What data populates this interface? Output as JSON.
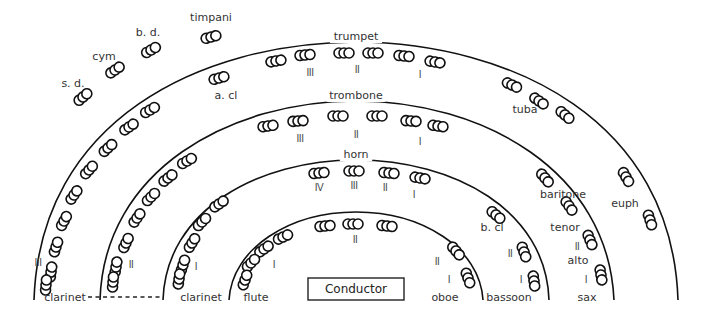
{
  "diagram": {
    "conductor": {
      "label": "Conductor",
      "x": 308,
      "y": 278,
      "w": 96,
      "h": 22
    },
    "arcs": [
      {
        "name": "outer-arc",
        "d": "M 34 300 C 40 120, 200 43, 356 42 C 512 43, 672 120, 678 300"
      },
      {
        "name": "second-arc",
        "d": "M 100 300 C 104 170, 230 101, 356 101 C 482 101, 608 170, 614 300"
      },
      {
        "name": "third-arc",
        "d": "M 163 300 C 166 210, 258 160, 356 160 C 454 160, 546 210, 549 300"
      },
      {
        "name": "inner-arc",
        "d": "M 229 300 C 232 248, 290 212, 356 212 C 422 212, 480 248, 483 300"
      }
    ],
    "section_labels": [
      {
        "text": "trumpet",
        "x": 356,
        "y": 40
      },
      {
        "text": "trombone",
        "x": 356,
        "y": 99
      },
      {
        "text": "horn",
        "x": 356,
        "y": 158
      },
      {
        "text": "timpani",
        "x": 211,
        "y": 21
      },
      {
        "text": "b. d.",
        "x": 148,
        "y": 36
      },
      {
        "text": "cym",
        "x": 104,
        "y": 60
      },
      {
        "text": "s. d.",
        "x": 73,
        "y": 87
      },
      {
        "text": "a. cl",
        "x": 226,
        "y": 99
      },
      {
        "text": "tuba",
        "x": 525,
        "y": 113
      },
      {
        "text": "baritone",
        "x": 563,
        "y": 198
      },
      {
        "text": "euph",
        "x": 625,
        "y": 207
      },
      {
        "text": "tenor",
        "x": 565,
        "y": 231
      },
      {
        "text": "b. cl",
        "x": 492,
        "y": 231
      },
      {
        "text": "alto",
        "x": 578,
        "y": 264
      },
      {
        "text": "clarinet",
        "x": 65,
        "y": 301
      },
      {
        "text": "clarinet",
        "x": 201,
        "y": 301
      },
      {
        "text": "flute",
        "x": 256,
        "y": 301
      },
      {
        "text": "oboe",
        "x": 445,
        "y": 301
      },
      {
        "text": "bassoon",
        "x": 509,
        "y": 301
      },
      {
        "text": "sax",
        "x": 587,
        "y": 301
      }
    ],
    "part_numbers": [
      {
        "text": "III",
        "x": 310,
        "y": 76
      },
      {
        "text": "II",
        "x": 357,
        "y": 73
      },
      {
        "text": "I",
        "x": 420,
        "y": 78
      },
      {
        "text": "III",
        "x": 300,
        "y": 142
      },
      {
        "text": "II",
        "x": 356,
        "y": 138
      },
      {
        "text": "I",
        "x": 420,
        "y": 145
      },
      {
        "text": "IV",
        "x": 319,
        "y": 191
      },
      {
        "text": "III",
        "x": 354,
        "y": 189
      },
      {
        "text": "II",
        "x": 385,
        "y": 191
      },
      {
        "text": "I",
        "x": 414,
        "y": 198
      },
      {
        "text": "II",
        "x": 355,
        "y": 243
      },
      {
        "text": "III",
        "x": 38,
        "y": 266
      },
      {
        "text": "II",
        "x": 131,
        "y": 268
      },
      {
        "text": "I",
        "x": 196,
        "y": 270
      },
      {
        "text": "I",
        "x": 274,
        "y": 268
      },
      {
        "text": "II",
        "x": 437,
        "y": 265
      },
      {
        "text": "I",
        "x": 449,
        "y": 283
      },
      {
        "text": "II",
        "x": 510,
        "y": 257
      },
      {
        "text": "I",
        "x": 521,
        "y": 283
      },
      {
        "text": "II",
        "x": 577,
        "y": 250
      },
      {
        "text": "I",
        "x": 586,
        "y": 283
      }
    ],
    "dashed_link": {
      "x1": 88,
      "y1": 297,
      "x2": 161,
      "y2": 297
    },
    "seats": [
      {
        "x": 211,
        "y": 37,
        "r": -15
      },
      {
        "x": 151,
        "y": 50,
        "r": -30
      },
      {
        "x": 115,
        "y": 70,
        "r": -35
      },
      {
        "x": 83,
        "y": 97,
        "r": -40
      },
      {
        "x": 219,
        "y": 78,
        "r": -15
      },
      {
        "x": 276,
        "y": 61,
        "r": -10
      },
      {
        "x": 305,
        "y": 55,
        "r": -5
      },
      {
        "x": 344,
        "y": 53,
        "r": 0
      },
      {
        "x": 373,
        "y": 53,
        "r": 0
      },
      {
        "x": 404,
        "y": 56,
        "r": 5
      },
      {
        "x": 435,
        "y": 62,
        "r": 10
      },
      {
        "x": 150,
        "y": 110,
        "r": -30
      },
      {
        "x": 129,
        "y": 127,
        "r": -35
      },
      {
        "x": 108,
        "y": 148,
        "r": -42
      },
      {
        "x": 89,
        "y": 170,
        "r": -48
      },
      {
        "x": 74,
        "y": 195,
        "r": -55
      },
      {
        "x": 64,
        "y": 221,
        "r": -62
      },
      {
        "x": 56,
        "y": 247,
        "r": -72
      },
      {
        "x": 51,
        "y": 272,
        "r": -82
      },
      {
        "x": 46,
        "y": 285,
        "r": -85
      },
      {
        "x": 268,
        "y": 126,
        "r": -8
      },
      {
        "x": 298,
        "y": 121,
        "r": -4
      },
      {
        "x": 338,
        "y": 116,
        "r": 0
      },
      {
        "x": 377,
        "y": 116,
        "r": 0
      },
      {
        "x": 411,
        "y": 121,
        "r": 4
      },
      {
        "x": 438,
        "y": 126,
        "r": 8
      },
      {
        "x": 187,
        "y": 161,
        "r": -30
      },
      {
        "x": 168,
        "y": 178,
        "r": -38
      },
      {
        "x": 151,
        "y": 197,
        "r": -45
      },
      {
        "x": 137,
        "y": 218,
        "r": -55
      },
      {
        "x": 126,
        "y": 243,
        "r": -65
      },
      {
        "x": 116,
        "y": 267,
        "r": -80
      },
      {
        "x": 113,
        "y": 282,
        "r": -85
      },
      {
        "x": 319,
        "y": 173,
        "r": -5
      },
      {
        "x": 354,
        "y": 171,
        "r": 0
      },
      {
        "x": 389,
        "y": 173,
        "r": 5
      },
      {
        "x": 420,
        "y": 178,
        "r": 10
      },
      {
        "x": 219,
        "y": 204,
        "r": -35
      },
      {
        "x": 202,
        "y": 222,
        "r": -45
      },
      {
        "x": 192,
        "y": 243,
        "r": -58
      },
      {
        "x": 183,
        "y": 265,
        "r": -72
      },
      {
        "x": 179,
        "y": 279,
        "r": -82
      },
      {
        "x": 283,
        "y": 237,
        "r": -25
      },
      {
        "x": 264,
        "y": 249,
        "r": -35
      },
      {
        "x": 251,
        "y": 263,
        "r": -45
      },
      {
        "x": 245,
        "y": 280,
        "r": -70
      },
      {
        "x": 325,
        "y": 226,
        "r": -5
      },
      {
        "x": 353,
        "y": 224,
        "r": 0
      },
      {
        "x": 387,
        "y": 226,
        "r": 5
      },
      {
        "x": 456,
        "y": 251,
        "r": 50
      },
      {
        "x": 468,
        "y": 278,
        "r": 70
      },
      {
        "x": 496,
        "y": 215,
        "r": 40
      },
      {
        "x": 524,
        "y": 252,
        "r": 70
      },
      {
        "x": 534,
        "y": 281,
        "r": 82
      },
      {
        "x": 512,
        "y": 85,
        "r": 25
      },
      {
        "x": 539,
        "y": 101,
        "r": 35
      },
      {
        "x": 565,
        "y": 115,
        "r": 40
      },
      {
        "x": 545,
        "y": 178,
        "r": 50
      },
      {
        "x": 569,
        "y": 206,
        "r": 55
      },
      {
        "x": 590,
        "y": 240,
        "r": 68
      },
      {
        "x": 601,
        "y": 275,
        "r": 80
      },
      {
        "x": 626,
        "y": 177,
        "r": 60
      },
      {
        "x": 650,
        "y": 220,
        "r": 72
      }
    ]
  }
}
